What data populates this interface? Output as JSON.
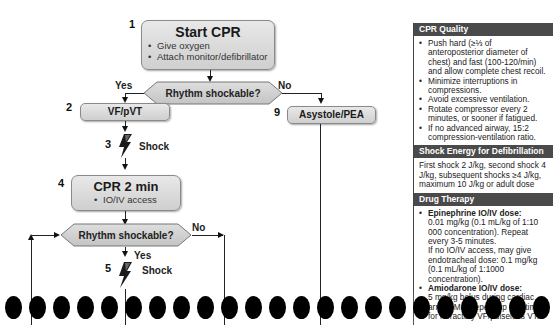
{
  "flowchart": {
    "steps": {
      "start": {
        "number": "1",
        "title": "Start CPR",
        "bullets": [
          "Give oxygen",
          "Attach monitor/defibrillator"
        ]
      },
      "decision1": {
        "text": "Rhythm shockable?",
        "yes_label": "Yes",
        "no_label": "No"
      },
      "vf": {
        "number": "2",
        "title": "VF/pVT"
      },
      "shock1": {
        "number": "3",
        "label": "Shock"
      },
      "cpr2": {
        "number": "4",
        "title": "CPR 2 min",
        "bullets": [
          "IO/IV access"
        ]
      },
      "decision2": {
        "text": "Rhythm shockable?",
        "yes_label": "Yes",
        "no_label": "No"
      },
      "shock2": {
        "number": "5",
        "label": "Shock"
      },
      "asystole": {
        "number": "9",
        "title": "Asystole/PEA"
      }
    }
  },
  "sidebar": {
    "cpr_quality": {
      "header": "CPR Quality",
      "items": [
        "Push hard (≥⅓ of anteroposterior diameter of chest) and fast (100-120/min) and allow complete chest recoil.",
        "Minimize interruptions in compressions.",
        "Avoid excessive ventilation.",
        "Rotate compressor every 2 minutes, or sooner if fatigued.",
        "If no advanced airway, 15:2 compression-ventilation ratio."
      ]
    },
    "shock_energy": {
      "header": "Shock Energy for Defibrillation",
      "text": "First shock 2 J/kg, second shock 4 J/kg, subsequent shocks ≥4 J/kg, maximum 10 J/kg or adult dose"
    },
    "drug_therapy": {
      "header": "Drug Therapy",
      "epinephrine": {
        "title": "Epinephrine IO/IV dose:",
        "text": "0.01 mg/kg (0.1 mL/kg of 1:10 000 concentration). Repeat every 3-5 minutes.",
        "note": "If no IO/IV access, may give endotracheal dose: 0.1 mg/kg (0.1 mL/kg of 1:1000 concentration)."
      },
      "amiodarone": {
        "title": "Amiodarone IO/IV dose:",
        "text": "5 mg/kg bolus during cardiac arrest. May repeat up to 2 times for refractory VF/pulseless VT."
      }
    }
  },
  "binder_holes": {
    "count": 23
  }
}
